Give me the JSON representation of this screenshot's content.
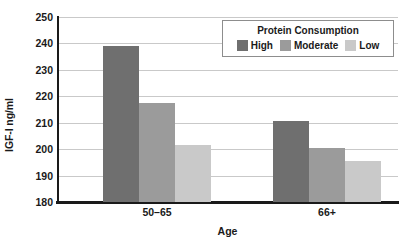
{
  "chart_data": {
    "type": "bar",
    "title": "",
    "xlabel": "Age",
    "ylabel": "IGF-I ng/ml",
    "categories": [
      "50–65",
      "66+"
    ],
    "series": [
      {
        "name": "High",
        "values": [
          239,
          210.8
        ],
        "color": "#6f6f6f"
      },
      {
        "name": "Moderate",
        "values": [
          217.6,
          200.4
        ],
        "color": "#9b9b9b"
      },
      {
        "name": "Low",
        "values": [
          201.6,
          195.4
        ],
        "color": "#c9c9c9"
      }
    ],
    "ylim": [
      180,
      250
    ],
    "ytick_step": 10,
    "yticks": [
      250,
      240,
      230,
      220,
      210,
      200,
      190,
      180
    ],
    "ytick_labels": [
      "250",
      "240",
      "230",
      "220",
      "210",
      "200",
      "190",
      "180"
    ],
    "grid": "horizontal",
    "legend_position": "top-right",
    "legend_title": "Protein Consumption",
    "gridline_color": "#c9c9c9",
    "axis_color": "#1a1a1a",
    "background_color": "#ffffff"
  },
  "axis": {
    "y_title": "IGF-I ng/ml",
    "x_title": "Age"
  },
  "legend": {
    "title": "Protein Consumption",
    "items": [
      {
        "label": "High",
        "color": "#6f6f6f"
      },
      {
        "label": "Moderate",
        "color": "#9b9b9b"
      },
      {
        "label": "Low",
        "color": "#c9c9c9"
      }
    ]
  }
}
